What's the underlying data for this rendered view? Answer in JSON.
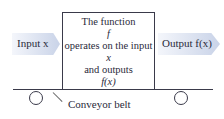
{
  "diagram": {
    "input_label": "Input x",
    "output_label": "Output f(x)",
    "box_lines": [
      "The function",
      "f",
      "operates on the input",
      "x",
      "and outputs",
      "f(x)"
    ],
    "belt_label": "Conveyor belt"
  }
}
